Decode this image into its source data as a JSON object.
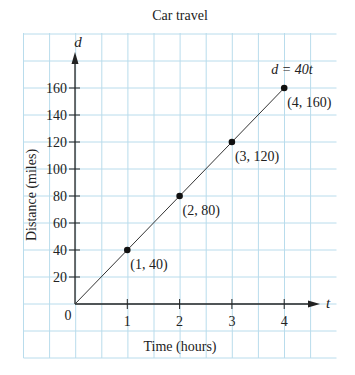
{
  "chart_data": {
    "type": "line",
    "title": "Car travel",
    "xlabel": "Time (hours)",
    "ylabel": "Distance (miles)",
    "x_axis_var": "t",
    "y_axis_var": "d",
    "origin_label": "0",
    "xlim": [
      0,
      5
    ],
    "ylim": [
      0,
      180
    ],
    "x_ticks": [
      1,
      2,
      3,
      4
    ],
    "y_ticks": [
      20,
      40,
      60,
      80,
      100,
      120,
      140,
      160
    ],
    "grid": true,
    "equation_label": "d = 40t",
    "series": [
      {
        "name": "d = 40t",
        "x": [
          0,
          1,
          2,
          3,
          4
        ],
        "y": [
          0,
          40,
          80,
          120,
          160
        ]
      }
    ],
    "points": [
      {
        "x": 1,
        "y": 40,
        "label": "(1, 40)"
      },
      {
        "x": 2,
        "y": 80,
        "label": "(2, 80)"
      },
      {
        "x": 3,
        "y": 120,
        "label": "(3, 120)"
      },
      {
        "x": 4,
        "y": 160,
        "label": "(4, 160)"
      }
    ],
    "colors": {
      "grid": "#b9dcec",
      "axis": "#222222",
      "line": "#333333",
      "point": "#111111"
    }
  }
}
